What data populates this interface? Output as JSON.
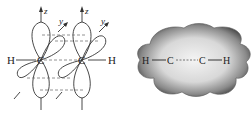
{
  "left_diagram": {
    "title": "p-orbital overlap (pi bonds)",
    "atoms": {
      "h_left": "H",
      "c_left": "C",
      "c_right": "C",
      "h_right": "H"
    },
    "axes": {
      "z_left": "z",
      "z_right": "z",
      "y_left": "y",
      "y_right": "y"
    }
  },
  "right_diagram": {
    "title": "pi electron cloud",
    "atoms": {
      "h_left": "H",
      "c_left": "C",
      "c_right": "C",
      "h_right": "H"
    }
  },
  "colors": {
    "line": "#333333",
    "dash": "#777777",
    "cloud_outer": "#5a5a5a",
    "cloud_inner": "#e6e6e6"
  }
}
